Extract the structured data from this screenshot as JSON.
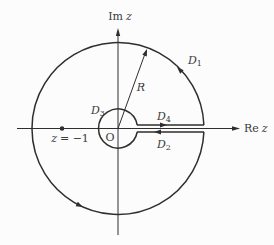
{
  "figure": {
    "kind": "keyhole-contour-in-complex-plane",
    "colors": {
      "background": "#fcfcfc",
      "line": "#2e2e2e",
      "text": "#3a3a3a"
    },
    "axis_labels": {
      "imaginary": {
        "prefix": "Im",
        "var": "z"
      },
      "real": {
        "prefix": "Re",
        "var": "z"
      }
    },
    "labels": {
      "origin": "O",
      "radius": "R",
      "pole": {
        "var": "z",
        "eq": "= −1"
      },
      "segments": {
        "d1": {
          "base": "D",
          "sub": "1"
        },
        "d2": {
          "base": "D",
          "sub": "2"
        },
        "d3": {
          "base": "D",
          "sub": "3"
        },
        "d4": {
          "base": "D",
          "sub": "4"
        }
      }
    }
  }
}
